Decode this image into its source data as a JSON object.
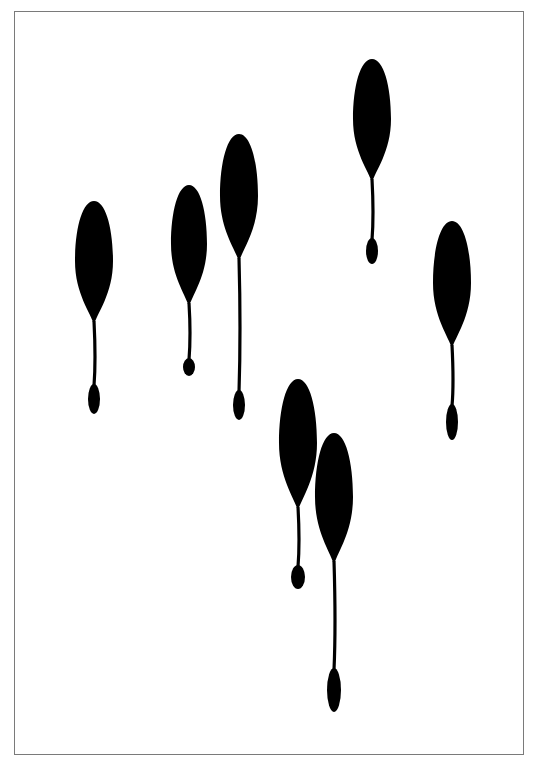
{
  "artwork": {
    "frame": {
      "left": 14,
      "top": 11,
      "right": 525,
      "bottom": 756,
      "border_color": "#7a7a7a"
    },
    "ink_color": "#000000",
    "background_color": "#ffffff",
    "drops": [
      {
        "cx": 94,
        "top": 201,
        "rx": 19,
        "ry": 60,
        "tail_end": 414,
        "tip_rx": 6,
        "tip_ry": 15
      },
      {
        "cx": 189,
        "top": 185,
        "rx": 18,
        "ry": 59,
        "tail_end": 376,
        "tip_rx": 6,
        "tip_ry": 9
      },
      {
        "cx": 239,
        "top": 134,
        "rx": 19,
        "ry": 62,
        "tail_end": 420,
        "tip_rx": 6,
        "tip_ry": 15
      },
      {
        "cx": 372,
        "top": 59,
        "rx": 19,
        "ry": 60,
        "tail_end": 264,
        "tip_rx": 6,
        "tip_ry": 13
      },
      {
        "cx": 452,
        "top": 221,
        "rx": 19,
        "ry": 62,
        "tail_end": 440,
        "tip_rx": 6,
        "tip_ry": 18
      },
      {
        "cx": 298,
        "top": 379,
        "rx": 19,
        "ry": 64,
        "tail_end": 589,
        "tip_rx": 7,
        "tip_ry": 12
      },
      {
        "cx": 334,
        "top": 433,
        "rx": 19,
        "ry": 64,
        "tail_end": 712,
        "tip_rx": 7,
        "tip_ry": 22
      }
    ]
  }
}
